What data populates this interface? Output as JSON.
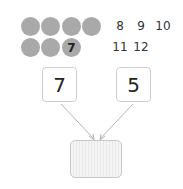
{
  "counters": {
    "filled_count": 7,
    "circle_color": "#a9a9a9",
    "marked_circle_label": "7"
  },
  "sequence": {
    "numbers": [
      "8",
      "9",
      "10",
      "11",
      "12"
    ]
  },
  "addends": {
    "left": "7",
    "right": "5"
  },
  "answer": {
    "value": ""
  }
}
